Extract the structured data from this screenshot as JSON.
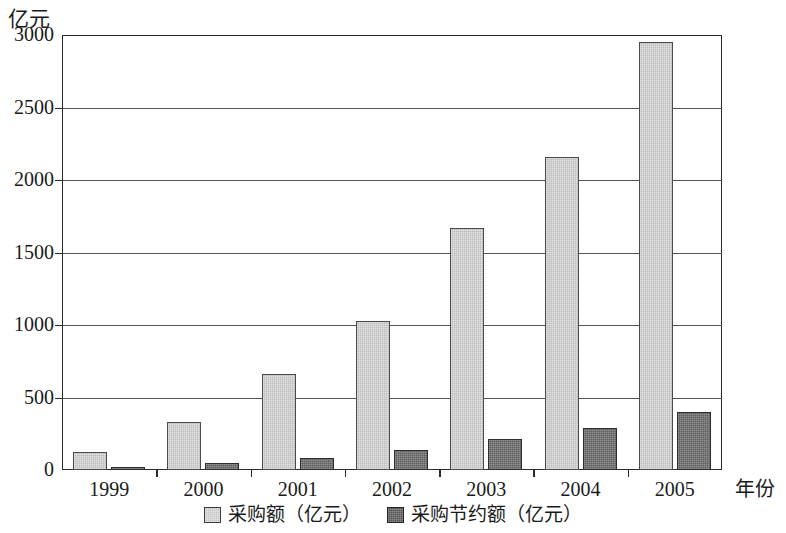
{
  "chart_data": {
    "type": "bar",
    "title": "",
    "subtitle": "",
    "xlabel": "年份",
    "ylabel": "亿元",
    "categories": [
      "1999",
      "2000",
      "2001",
      "2002",
      "2003",
      "2004",
      "2005"
    ],
    "series": [
      {
        "name": "采购额（亿元）",
        "color": "#bdbdbd",
        "values": [
          125,
          330,
          660,
          1030,
          1670,
          2160,
          2950
        ]
      },
      {
        "name": "采购节约额（亿元）",
        "color": "#5e5e5e",
        "values": [
          20,
          50,
          85,
          135,
          215,
          290,
          400
        ]
      }
    ],
    "ylim": [
      0,
      3000
    ],
    "ytick_labels": [
      "3000",
      "2500",
      "2000",
      "1500",
      "1000",
      "500",
      "0"
    ],
    "ytick_values": [
      3000,
      2500,
      2000,
      1500,
      1000,
      500,
      0
    ],
    "grid": true,
    "grid_axis": "y",
    "legend_position": "bottom-center"
  },
  "axes": {
    "y_title": "亿元",
    "x_title": "年份"
  },
  "legend": {
    "items": [
      {
        "label": "采购额（亿元）",
        "swatch": "light-gray-square"
      },
      {
        "label": "采购节约额（亿元）",
        "swatch": "dark-gray-square"
      }
    ]
  }
}
